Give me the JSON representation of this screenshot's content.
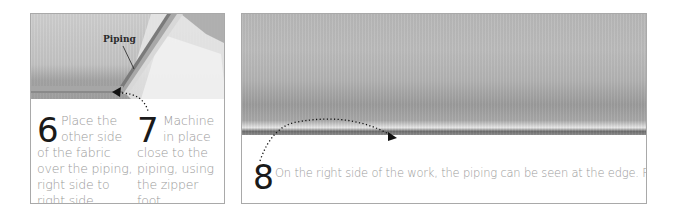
{
  "panels": {
    "left": {
      "photo": {
        "description": "fabric with piping inserted, piping strip laid diagonally",
        "label": "Piping"
      },
      "steps": [
        {
          "number": "6",
          "text_first": "Place the other side",
          "text_rest": "of the fabric over the piping, right side to right side."
        },
        {
          "number": "7",
          "text_first": "Machine in place",
          "text_rest": "close to the piping, using the zipper foot."
        }
      ]
    },
    "right": {
      "photo": {
        "description": "right side of fabric with piping visible along edge"
      },
      "steps": [
        {
          "number": "8",
          "text": "On the right side of the work, the piping can be seen at the edge. Press to finish."
        }
      ]
    }
  },
  "colors": {
    "border": "#a9a9a9",
    "numeral": "#1a1a1a",
    "body_text": "#9a9a9a",
    "arrow": "#111111"
  }
}
